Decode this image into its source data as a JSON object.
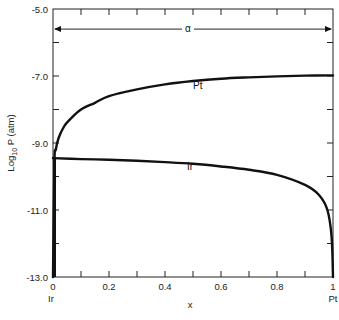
{
  "chart_data": {
    "type": "line",
    "title": "",
    "xlabel": "x",
    "ylabel": "Log10 P (atm)",
    "ylabel_parts": {
      "base": "Log",
      "sub": "10",
      "rest": " P (atm)"
    },
    "xlim": [
      0,
      1
    ],
    "ylim": [
      -13.0,
      -5.0
    ],
    "grid": false,
    "legend": "inline curve labels",
    "x_ticks": [
      {
        "value": 0,
        "label": "0"
      },
      {
        "value": 0.2,
        "label": "0.2"
      },
      {
        "value": 0.4,
        "label": "0.4"
      },
      {
        "value": 0.6,
        "label": "0.6"
      },
      {
        "value": 0.8,
        "label": "0.8"
      },
      {
        "value": 1,
        "label": "1"
      }
    ],
    "x_minor_ticks": [
      0.1,
      0.3,
      0.5,
      0.7,
      0.9
    ],
    "y_ticks": [
      {
        "value": -5.0,
        "label": "-5.0"
      },
      {
        "value": -7.0,
        "label": "-7.0"
      },
      {
        "value": -9.0,
        "label": "-9.0"
      },
      {
        "value": -11.0,
        "label": "-11.0"
      },
      {
        "value": -13.0,
        "label": "-13.0"
      }
    ],
    "y_minor_ticks": [
      -6.0,
      -8.0,
      -10.0,
      -12.0
    ],
    "x_end_labels": {
      "left": "Ir",
      "right": "Pt"
    },
    "annotations": [
      {
        "text": "α",
        "description": "double-headed arrow spanning x = 0 to 1 at log P ≈ -5.6"
      }
    ],
    "series": [
      {
        "name": "Pt",
        "label": "Pt",
        "x": [
          0.0,
          0.005,
          0.01,
          0.02,
          0.04,
          0.06,
          0.1,
          0.15,
          0.2,
          0.3,
          0.4,
          0.5,
          0.6,
          0.7,
          0.8,
          0.9,
          1.0
        ],
        "y": [
          -13.0,
          -9.6,
          -9.2,
          -8.85,
          -8.5,
          -8.3,
          -8.0,
          -7.8,
          -7.6,
          -7.4,
          -7.25,
          -7.15,
          -7.08,
          -7.04,
          -7.01,
          -6.99,
          -6.98
        ]
      },
      {
        "name": "Ir",
        "label": "Ir",
        "x": [
          0.0,
          0.1,
          0.2,
          0.3,
          0.4,
          0.5,
          0.6,
          0.7,
          0.8,
          0.9,
          0.95,
          0.98,
          0.995,
          1.0
        ],
        "y": [
          -9.45,
          -9.48,
          -9.5,
          -9.53,
          -9.57,
          -9.62,
          -9.7,
          -9.8,
          -9.95,
          -10.25,
          -10.55,
          -11.0,
          -11.8,
          -13.0
        ]
      }
    ]
  }
}
